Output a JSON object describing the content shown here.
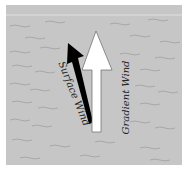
{
  "diagram": {
    "title": "",
    "background_color": "#c6c6c6",
    "labels": {
      "surface_wind": "Surface Wind",
      "gradient_wind": "Gradient Wind"
    },
    "arrows": [
      {
        "name": "gradient-wind",
        "color": "#ffffff",
        "direction": "north"
      },
      {
        "name": "surface-wind",
        "color": "#000000",
        "direction": "north-northwest"
      }
    ]
  }
}
